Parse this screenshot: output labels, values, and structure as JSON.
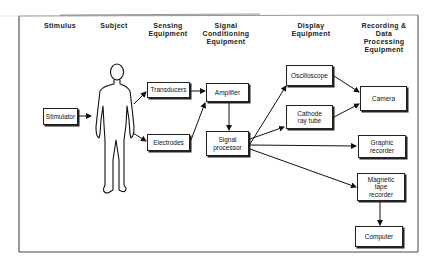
{
  "diagram": {
    "columns": [
      {
        "id": "stimulus",
        "label": "Stimulus"
      },
      {
        "id": "subject",
        "label": "Subject"
      },
      {
        "id": "sensing",
        "label": "Sensing\nEquipment"
      },
      {
        "id": "conditioning",
        "label": "Signal\nConditioning\nEquipment"
      },
      {
        "id": "display",
        "label": "Display\nEquipment"
      },
      {
        "id": "recording",
        "label": "Recording &\nData\nProcessing\nEquipment"
      }
    ],
    "nodes": {
      "stimulator": "Stimulator",
      "transducers": "Transducers",
      "electrodes": "Electrodes",
      "amplifier": "Amplifier",
      "signal_processor": "Signal\nprocessor",
      "oscilloscope": "Oscilloscope",
      "cathode_ray_tube": "Cathode\nray tube",
      "camera": "Camera",
      "graphic_recorder": "Graphic\nrecorder",
      "magnetic_tape_recorder": "Magnetic\ntape\nrecorder",
      "computer": "Computer"
    },
    "subject_figure": "human-figure",
    "edges": [
      [
        "stimulator",
        "subject"
      ],
      [
        "subject",
        "transducers"
      ],
      [
        "subject",
        "electrodes"
      ],
      [
        "transducers",
        "amplifier"
      ],
      [
        "electrodes",
        "amplifier"
      ],
      [
        "amplifier",
        "signal_processor"
      ],
      [
        "signal_processor",
        "oscilloscope"
      ],
      [
        "signal_processor",
        "cathode_ray_tube"
      ],
      [
        "signal_processor",
        "graphic_recorder"
      ],
      [
        "signal_processor",
        "magnetic_tape_recorder"
      ],
      [
        "oscilloscope",
        "camera"
      ],
      [
        "cathode_ray_tube",
        "camera"
      ],
      [
        "magnetic_tape_recorder",
        "computer"
      ]
    ]
  }
}
